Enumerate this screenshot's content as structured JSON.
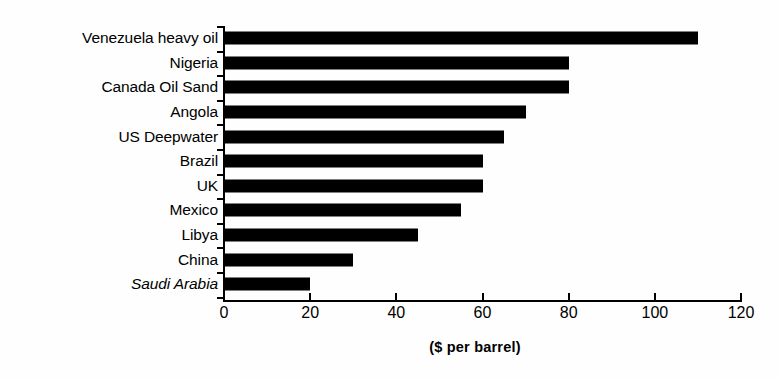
{
  "chart_data": {
    "type": "bar",
    "orientation": "horizontal",
    "title": "",
    "subtitle": "",
    "xlabel": "($ per barrel)",
    "ylabel": "",
    "xlim": [
      0,
      120
    ],
    "xticks": [
      0,
      20,
      40,
      60,
      80,
      100,
      120
    ],
    "xtick_labels": [
      "0",
      "20",
      "40",
      "60",
      "80",
      "100",
      "120"
    ],
    "grid": false,
    "legend": null,
    "bar_color": "#000000",
    "background_color": "#ffffff",
    "categories": [
      "Venezuela heavy oil",
      "Nigeria",
      "Canada Oil Sand",
      "Angola",
      "US Deepwater",
      "Brazil",
      "UK",
      "Mexico",
      "Libya",
      "China",
      "Saudi Arabia"
    ],
    "values": [
      110,
      80,
      80,
      70,
      65,
      60,
      60,
      55,
      45,
      30,
      20
    ],
    "emphasis": {
      "italic_categories": [
        "Saudi Arabia"
      ]
    },
    "rows": [
      {
        "label": "Venezuela heavy oil",
        "value": 110,
        "italic": false
      },
      {
        "label": "Nigeria",
        "value": 80,
        "italic": false
      },
      {
        "label": "Canada Oil Sand",
        "value": 80,
        "italic": false
      },
      {
        "label": "Angola",
        "value": 70,
        "italic": false
      },
      {
        "label": "US Deepwater",
        "value": 65,
        "italic": false
      },
      {
        "label": "Brazil",
        "value": 60,
        "italic": false
      },
      {
        "label": "UK",
        "value": 60,
        "italic": false
      },
      {
        "label": "Mexico",
        "value": 55,
        "italic": false
      },
      {
        "label": "Libya",
        "value": 45,
        "italic": false
      },
      {
        "label": "China",
        "value": 30,
        "italic": false
      },
      {
        "label": "Saudi Arabia",
        "value": 20,
        "italic": true
      }
    ]
  }
}
